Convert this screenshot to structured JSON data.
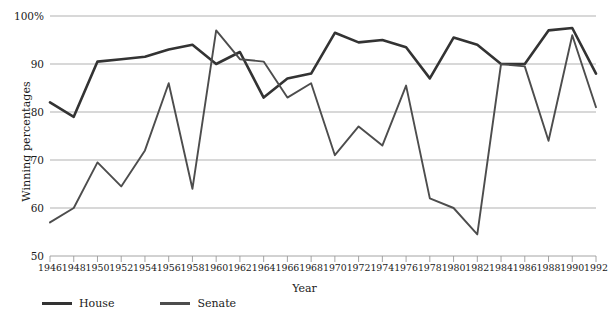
{
  "chart_data": {
    "type": "line",
    "title": "",
    "xlabel": "Year",
    "ylabel": "Winning percentages",
    "grid": true,
    "legend_position": "bottom",
    "ylim": [
      50,
      100
    ],
    "yticks": [
      "50",
      "60",
      "70",
      "80",
      "90",
      "100%"
    ],
    "ytick_values": [
      50,
      60,
      70,
      80,
      90,
      100
    ],
    "categories": [
      "1946",
      "1948",
      "1950",
      "1952",
      "1954",
      "1956",
      "1958",
      "1960",
      "1962",
      "1964",
      "1966",
      "1968",
      "1970",
      "1972",
      "1974",
      "1976",
      "1978",
      "1980",
      "1982",
      "1984",
      "1986",
      "1988",
      "1990",
      "1992"
    ],
    "series": [
      {
        "name": "House",
        "color": "#333333",
        "values": [
          82,
          79,
          90.5,
          91,
          91.5,
          93,
          94,
          90,
          92.5,
          83,
          87,
          88,
          96.5,
          94.5,
          95,
          93.5,
          87,
          95.5,
          94,
          90,
          90,
          97,
          97.5,
          88
        ]
      },
      {
        "name": "Senate",
        "color": "#4d4d4d",
        "values": [
          57,
          60,
          69.5,
          64.5,
          72,
          86,
          64,
          97,
          91,
          90.5,
          83,
          86,
          71,
          77,
          73,
          85.5,
          62,
          60,
          54.5,
          90,
          89.5,
          74,
          96,
          81
        ]
      }
    ]
  },
  "legend": {
    "house_label": "House",
    "senate_label": "Senate"
  },
  "axis": {
    "y_title": "Winning percentages",
    "x_title": "Year",
    "y_tick_0": "50",
    "y_tick_1": "60",
    "y_tick_2": "70",
    "y_tick_3": "80",
    "y_tick_4": "90",
    "y_tick_5": "100%"
  }
}
